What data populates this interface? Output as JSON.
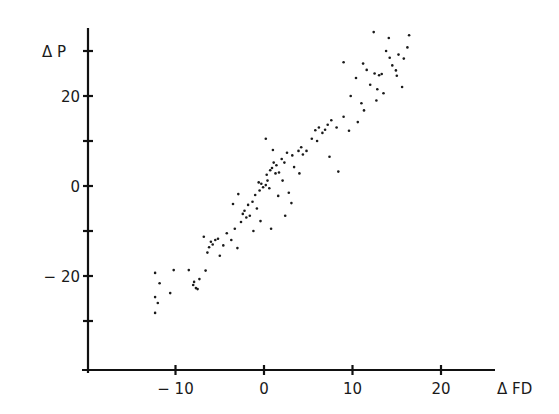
{
  "chart_data": {
    "type": "scatter",
    "title": "",
    "xlabel": "Δ FD",
    "ylabel": "Δ P",
    "xlim": [
      -19.8,
      26.0
    ],
    "ylim": [
      -40.7,
      35.0
    ],
    "grid": false,
    "legend": null,
    "x_ticks": [
      {
        "value": -10,
        "label": "− 10"
      },
      {
        "value": 0,
        "label": "0"
      },
      {
        "value": 10,
        "label": "10"
      },
      {
        "value": 20,
        "label": "20"
      }
    ],
    "y_ticks": [
      {
        "value": 30,
        "label": ""
      },
      {
        "value": 20,
        "label": "20"
      },
      {
        "value": 10,
        "label": ""
      },
      {
        "value": 0,
        "label": "0"
      },
      {
        "value": -10,
        "label": ""
      },
      {
        "value": -20,
        "label": "− 20"
      },
      {
        "value": -30,
        "label": ""
      }
    ],
    "series": [
      {
        "name": "observations",
        "color": "#1a1a1a",
        "points": [
          [
            -12.3,
            -19.3
          ],
          [
            -11.8,
            -21.6
          ],
          [
            -12.3,
            -24.7
          ],
          [
            -12.0,
            -26.0
          ],
          [
            -12.3,
            -28.2
          ],
          [
            -10.2,
            -18.7
          ],
          [
            -10.6,
            -23.8
          ],
          [
            -8.5,
            -18.7
          ],
          [
            -8.0,
            -22.0
          ],
          [
            -7.7,
            -22.7
          ],
          [
            -7.3,
            -20.7
          ],
          [
            -7.5,
            -22.9
          ],
          [
            -7.9,
            -21.3
          ],
          [
            -6.6,
            -18.8
          ],
          [
            -6.0,
            -12.4
          ],
          [
            -5.8,
            -13.0
          ],
          [
            -6.2,
            -13.6
          ],
          [
            -5.5,
            -12.0
          ],
          [
            -6.4,
            -14.8
          ],
          [
            -5.2,
            -11.7
          ],
          [
            -6.8,
            -11.3
          ],
          [
            -5.0,
            -15.5
          ],
          [
            -4.6,
            -13.2
          ],
          [
            -4.2,
            -10.5
          ],
          [
            -3.7,
            -12.0
          ],
          [
            -3.3,
            -9.5
          ],
          [
            -3.0,
            -13.8
          ],
          [
            -2.6,
            -8.0
          ],
          [
            -2.4,
            -6.2
          ],
          [
            -2.0,
            -7.0
          ],
          [
            -2.2,
            -5.5
          ],
          [
            -1.6,
            -6.6
          ],
          [
            -1.8,
            -4.2
          ],
          [
            -1.3,
            -3.5
          ],
          [
            -1.0,
            -2.0
          ],
          [
            -0.8,
            -5.0
          ],
          [
            -0.5,
            -1.0
          ],
          [
            -0.3,
            0.5
          ],
          [
            -0.6,
            0.8
          ],
          [
            -0.1,
            -0.3
          ],
          [
            0.2,
            0.2
          ],
          [
            0.4,
            1.2
          ],
          [
            0.6,
            -0.5
          ],
          [
            0.3,
            2.5
          ],
          [
            0.7,
            3.5
          ],
          [
            0.9,
            4.0
          ],
          [
            1.1,
            5.2
          ],
          [
            1.4,
            4.6
          ],
          [
            1.3,
            2.8
          ],
          [
            1.7,
            3.0
          ],
          [
            2.0,
            6.0
          ],
          [
            2.3,
            5.2
          ],
          [
            2.6,
            7.4
          ],
          [
            2.1,
            1.2
          ],
          [
            2.8,
            -1.5
          ],
          [
            3.2,
            6.8
          ],
          [
            3.4,
            4.2
          ],
          [
            3.9,
            7.8
          ],
          [
            4.2,
            8.6
          ],
          [
            4.4,
            7.0
          ],
          [
            4.8,
            7.8
          ],
          [
            4.0,
            2.8
          ],
          [
            3.1,
            -3.8
          ],
          [
            -0.4,
            -7.8
          ],
          [
            0.8,
            -9.5
          ],
          [
            2.4,
            -6.6
          ],
          [
            -2.9,
            -1.8
          ],
          [
            -3.5,
            -4.0
          ],
          [
            1.0,
            8.0
          ],
          [
            0.2,
            10.5
          ],
          [
            1.6,
            -2.2
          ],
          [
            -1.2,
            -10.0
          ],
          [
            5.8,
            12.4
          ],
          [
            6.2,
            13.0
          ],
          [
            6.6,
            11.8
          ],
          [
            7.2,
            13.6
          ],
          [
            7.6,
            14.6
          ],
          [
            5.4,
            10.5
          ],
          [
            6.9,
            12.5
          ],
          [
            8.2,
            13.0
          ],
          [
            9.0,
            15.4
          ],
          [
            9.6,
            12.3
          ],
          [
            7.4,
            6.5
          ],
          [
            8.4,
            3.2
          ],
          [
            6.0,
            10.0
          ],
          [
            10.6,
            14.2
          ],
          [
            11.3,
            16.8
          ],
          [
            9.8,
            20.0
          ],
          [
            9.0,
            27.5
          ],
          [
            10.4,
            24.0
          ],
          [
            11.6,
            25.8
          ],
          [
            11.2,
            27.2
          ],
          [
            12.5,
            25.0
          ],
          [
            13.0,
            24.6
          ],
          [
            12.0,
            22.5
          ],
          [
            12.8,
            21.5
          ],
          [
            13.5,
            20.6
          ],
          [
            14.2,
            28.5
          ],
          [
            14.5,
            26.8
          ],
          [
            15.0,
            24.5
          ],
          [
            15.6,
            22.0
          ],
          [
            14.9,
            25.7
          ],
          [
            16.2,
            30.8
          ],
          [
            15.2,
            29.2
          ],
          [
            13.8,
            30.0
          ],
          [
            12.4,
            34.2
          ],
          [
            14.1,
            32.9
          ],
          [
            13.3,
            24.9
          ],
          [
            12.7,
            19.0
          ],
          [
            11.0,
            18.4
          ],
          [
            16.4,
            33.5
          ],
          [
            15.8,
            28.3
          ]
        ]
      }
    ]
  }
}
